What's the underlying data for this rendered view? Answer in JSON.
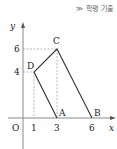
{
  "tag": "≫ 학평 기출",
  "axes": {
    "x_label": "x",
    "y_label": "y",
    "origin_label": "O"
  },
  "ticks": {
    "x": [
      "1",
      "3",
      "6"
    ],
    "y": [
      "4",
      "6"
    ]
  },
  "points": [
    {
      "name": "A",
      "x": 3,
      "y": 0
    },
    {
      "name": "B",
      "x": 6,
      "y": 0
    },
    {
      "name": "C",
      "x": 3,
      "y": 6
    },
    {
      "name": "D",
      "x": 1,
      "y": 4
    }
  ]
}
